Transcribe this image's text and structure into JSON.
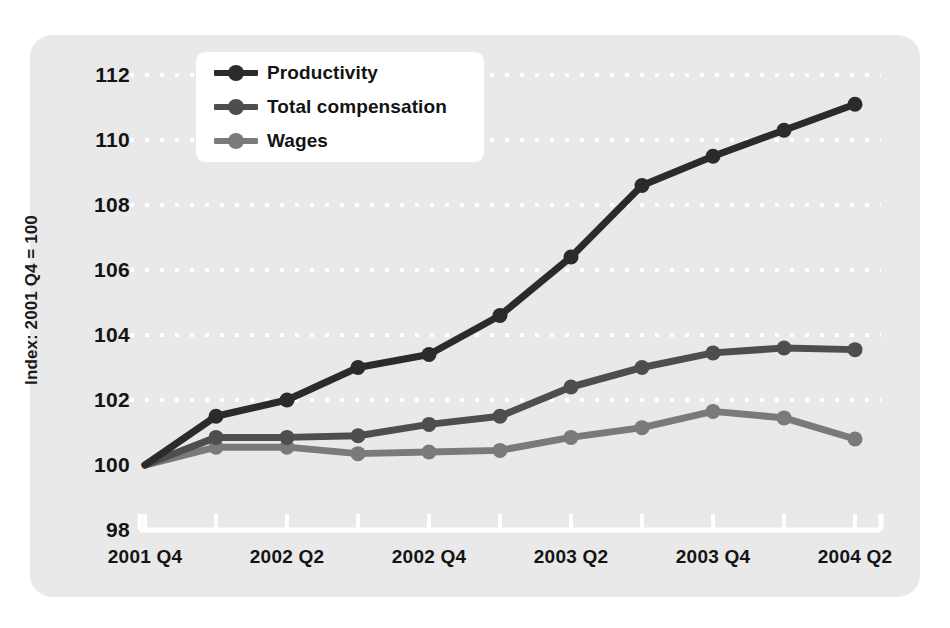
{
  "chart_data": {
    "type": "line",
    "title": "",
    "xlabel": "",
    "ylabel": "Index: 2001 Q4 = 100",
    "ylim": [
      98,
      112
    ],
    "yticks": [
      98,
      100,
      102,
      104,
      106,
      108,
      110,
      112
    ],
    "grid": "horizontal-dotted-white",
    "legend_position": "top-left",
    "x": [
      "2001 Q4",
      "2002 Q1",
      "2002 Q2",
      "2002 Q3",
      "2002 Q4",
      "2003 Q1",
      "2003 Q2",
      "2003 Q3",
      "2003 Q4",
      "2004 Q1",
      "2004 Q2"
    ],
    "xtick_labels": [
      "2001 Q4",
      "2002 Q2",
      "2002 Q4",
      "2003 Q2",
      "2003 Q4",
      "2004 Q2"
    ],
    "xtick_label_indices": [
      0,
      2,
      4,
      6,
      8,
      10
    ],
    "series": [
      {
        "name": "Productivity",
        "color": "#2b2b2b",
        "values": [
          100.0,
          101.5,
          102.0,
          103.0,
          103.4,
          104.6,
          106.4,
          108.6,
          109.5,
          110.3,
          111.1
        ]
      },
      {
        "name": "Total compensation",
        "color": "#4e4e4e",
        "values": [
          100.0,
          100.85,
          100.85,
          100.9,
          101.25,
          101.5,
          102.4,
          103.0,
          103.45,
          103.6,
          103.55
        ]
      },
      {
        "name": "Wages",
        "color": "#7a7a7a",
        "values": [
          100.0,
          100.55,
          100.55,
          100.35,
          100.4,
          100.45,
          100.85,
          101.15,
          101.65,
          101.45,
          100.8
        ]
      }
    ]
  },
  "panel": {
    "background_color": "#e9e9e9",
    "page_background_color": "#ffffff",
    "axis_color": "#ffffff",
    "gridline_color": "#ffffff"
  },
  "legend": {
    "entries": [
      {
        "label": "Productivity"
      },
      {
        "label": "Total compensation"
      },
      {
        "label": "Wages"
      }
    ]
  }
}
